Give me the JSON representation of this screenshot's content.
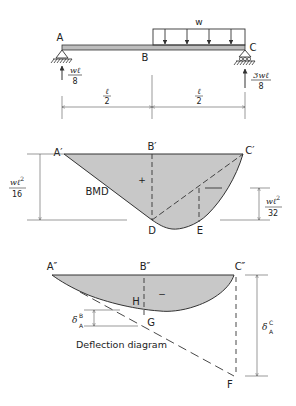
{
  "beam": {
    "label_A": "A",
    "label_B": "B",
    "label_C": "C",
    "load_label": "w",
    "reaction_A": {
      "num": "wℓ",
      "den": "8"
    },
    "reaction_C": {
      "num": "3wℓ",
      "den": "8"
    },
    "span_left": {
      "num": "ℓ",
      "den": "2"
    },
    "span_right": {
      "num": "ℓ",
      "den": "2"
    }
  },
  "bmd": {
    "label_A": "A′",
    "label_B": "B′",
    "label_C": "C′",
    "label_D": "D",
    "label_E": "E",
    "title": "BMD",
    "sign": "+",
    "dim_left": {
      "num": "wℓ",
      "sup": "2",
      "den": "16"
    },
    "dim_right": {
      "num": "wℓ",
      "sup": "2",
      "den": "32"
    },
    "fill_color": "#c8c8c8"
  },
  "deflection": {
    "label_A": "A″",
    "label_B": "B″",
    "label_C": "C″",
    "label_H": "H",
    "label_G": "G",
    "label_F": "F",
    "sign": "−",
    "title": "Deflection diagram",
    "delta_B": {
      "base": "δ",
      "sup": "B",
      "sub": "A"
    },
    "delta_C": {
      "base": "δ",
      "sup": "C",
      "sub": "A"
    },
    "fill_color": "#c8c8c8"
  }
}
